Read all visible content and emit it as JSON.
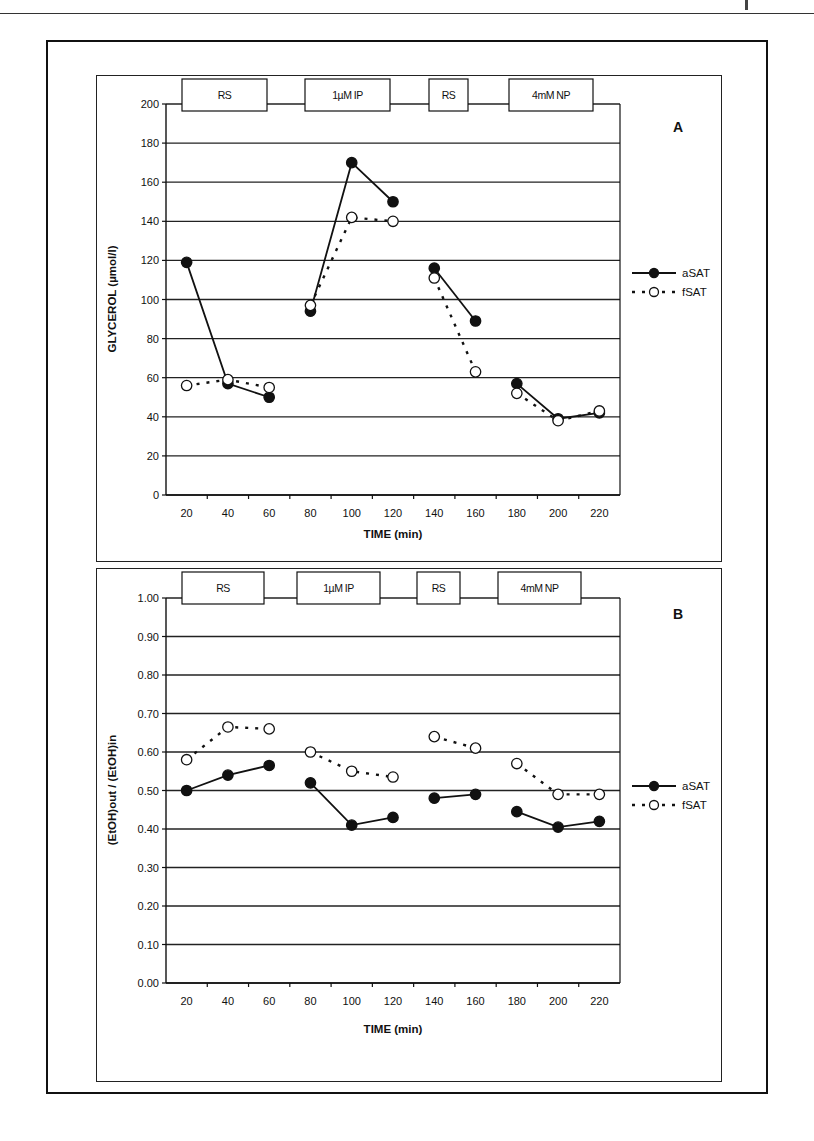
{
  "chart_data": [
    {
      "type": "line",
      "panel_label": "A",
      "title": "",
      "xlabel": "TIME (min)",
      "ylabel": "GLYCEROL (µmol/l)",
      "x": [
        20,
        40,
        60,
        80,
        100,
        120,
        140,
        160,
        180,
        200,
        220
      ],
      "xticks": [
        "20",
        "40",
        "60",
        "80",
        "100",
        "120",
        "140",
        "160",
        "180",
        "200",
        "220"
      ],
      "ylim": [
        0,
        200
      ],
      "yticks": [
        "0",
        "20",
        "40",
        "60",
        "80",
        "100",
        "120",
        "140",
        "160",
        "180",
        "200"
      ],
      "grid": true,
      "segments": [
        [
          20,
          40,
          60
        ],
        [
          80,
          100,
          120
        ],
        [
          140,
          160
        ],
        [
          180,
          200,
          220
        ]
      ],
      "phases": [
        {
          "label": "RS",
          "x_start": 20,
          "x_end": 60
        },
        {
          "label": "1µM IP",
          "x_start": 80,
          "x_end": 120
        },
        {
          "label": "RS",
          "x_start": 140,
          "x_end": 160
        },
        {
          "label": "4mM NP",
          "x_start": 180,
          "x_end": 220
        }
      ],
      "legend_position": "right",
      "series": [
        {
          "name": "aSAT",
          "marker": "filled-circle",
          "line": "solid",
          "values": [
            119,
            57,
            50,
            94,
            170,
            150,
            116,
            89,
            57,
            39,
            42
          ]
        },
        {
          "name": "fSAT",
          "marker": "open-circle",
          "line": "dashed",
          "values": [
            56,
            59,
            55,
            97,
            142,
            140,
            111,
            63,
            52,
            38,
            43
          ]
        }
      ]
    },
    {
      "type": "line",
      "panel_label": "B",
      "title": "",
      "xlabel": "TIME (min)",
      "ylabel": "(EtOH)out / (EtOH)in",
      "x": [
        20,
        40,
        60,
        80,
        100,
        120,
        140,
        160,
        180,
        200,
        220
      ],
      "xticks": [
        "20",
        "40",
        "60",
        "80",
        "100",
        "120",
        "140",
        "160",
        "180",
        "200",
        "220"
      ],
      "ylim": [
        0,
        1
      ],
      "yticks": [
        "0.00",
        "0.10",
        "0.20",
        "0.30",
        "0.40",
        "0.50",
        "0.60",
        "0.70",
        "0.80",
        "0.90",
        "1.00"
      ],
      "grid": true,
      "segments": [
        [
          20,
          40,
          60
        ],
        [
          80,
          100,
          120
        ],
        [
          140,
          160
        ],
        [
          180,
          200,
          220
        ]
      ],
      "phases": [
        {
          "label": "RS",
          "x_start": 20,
          "x_end": 60
        },
        {
          "label": "1µM IP",
          "x_start": 80,
          "x_end": 120
        },
        {
          "label": "RS",
          "x_start": 140,
          "x_end": 160
        },
        {
          "label": "4mM NP",
          "x_start": 180,
          "x_end": 220
        }
      ],
      "legend_position": "right",
      "series": [
        {
          "name": "aSAT",
          "marker": "filled-circle",
          "line": "solid",
          "values": [
            0.5,
            0.54,
            0.565,
            0.52,
            0.41,
            0.43,
            0.48,
            0.49,
            0.445,
            0.405,
            0.42
          ]
        },
        {
          "name": "fSAT",
          "marker": "open-circle",
          "line": "dashed",
          "values": [
            0.58,
            0.665,
            0.66,
            0.6,
            0.55,
            0.535,
            0.64,
            0.61,
            0.57,
            0.49,
            0.49
          ]
        }
      ]
    }
  ],
  "layout": [
    {
      "plot": {
        "left": 69,
        "top": 28,
        "right": 523,
        "bottom": 419
      },
      "x_domain": [
        10,
        230
      ],
      "phase_boxes": [
        {
          "x0": 85,
          "x1": 170
        },
        {
          "x0": 208,
          "x1": 293
        },
        {
          "x0": 332,
          "x1": 371
        },
        {
          "x0": 412,
          "x1": 496
        }
      ],
      "phase_box_y": [
        3,
        35
      ],
      "panel_label_pos": [
        581,
        56
      ],
      "legend_pos": [
        535,
        197
      ],
      "xlabel_pos": [
        296,
        462
      ],
      "ylabel_pos": [
        19,
        223
      ]
    },
    {
      "plot": {
        "left": 69,
        "top": 29,
        "right": 523,
        "bottom": 414
      },
      "x_domain": [
        10,
        230
      ],
      "phase_boxes": [
        {
          "x0": 85,
          "x1": 167
        },
        {
          "x0": 200,
          "x1": 283
        },
        {
          "x0": 320,
          "x1": 363
        },
        {
          "x0": 401,
          "x1": 484
        }
      ],
      "phase_box_y": [
        3,
        35
      ],
      "panel_label_pos": [
        581,
        50
      ],
      "legend_pos": [
        535,
        217
      ],
      "xlabel_pos": [
        296,
        464
      ],
      "ylabel_pos": [
        19,
        221
      ]
    }
  ],
  "colors": {
    "ink": "#111111",
    "grid": "#222222",
    "background": "#ffffff"
  }
}
